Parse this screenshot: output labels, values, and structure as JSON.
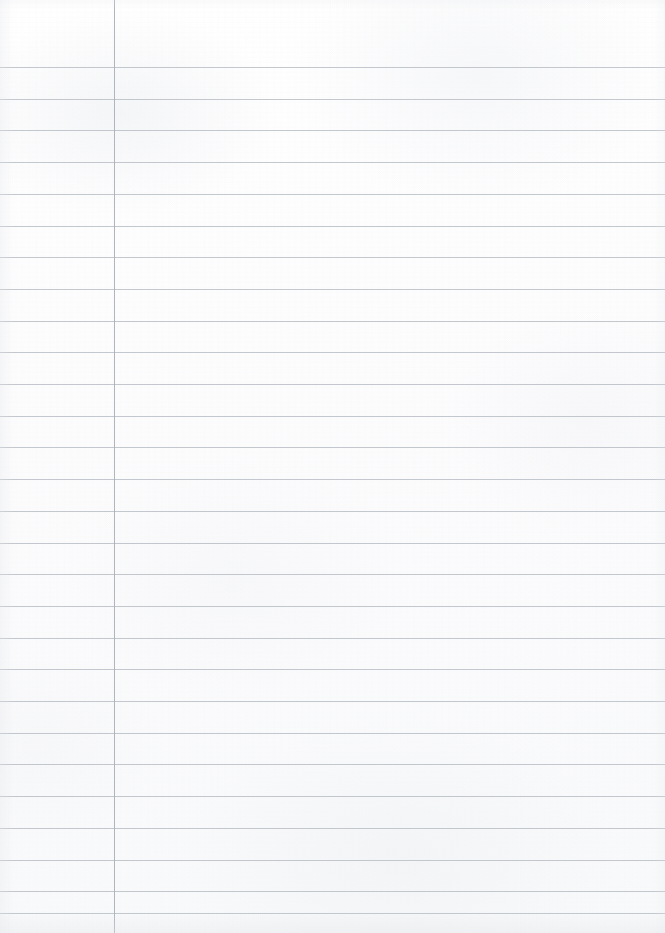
{
  "page": {
    "kind": "ruled-notebook-page",
    "width": 665,
    "height": 933,
    "content_text": "",
    "is_blank": true
  },
  "paper": {
    "background_color": "#fdfdfd",
    "texture": "scanned-paper-mottling"
  },
  "ruling": {
    "horizontal_line_color": "#b9bec6",
    "horizontal_line_thickness": 1,
    "line_spacing": 31.7,
    "first_line_y": 67,
    "line_count": 28,
    "horizontal_line_y_positions": [
      67,
      98.7,
      130.4,
      162.1,
      193.8,
      225.5,
      257.2,
      288.9,
      320.6,
      352.3,
      384.0,
      415.7,
      447.4,
      479.1,
      510.8,
      542.5,
      574.2,
      605.9,
      637.6,
      669.3,
      701.0,
      732.7,
      764.4,
      796.1,
      827.8,
      859.5,
      891.2,
      913.0
    ]
  },
  "margin": {
    "vertical_line_color": "#a9aeb7",
    "vertical_line_thickness": 1,
    "vertical_line_x": 114,
    "label": "left-margin-rule"
  }
}
